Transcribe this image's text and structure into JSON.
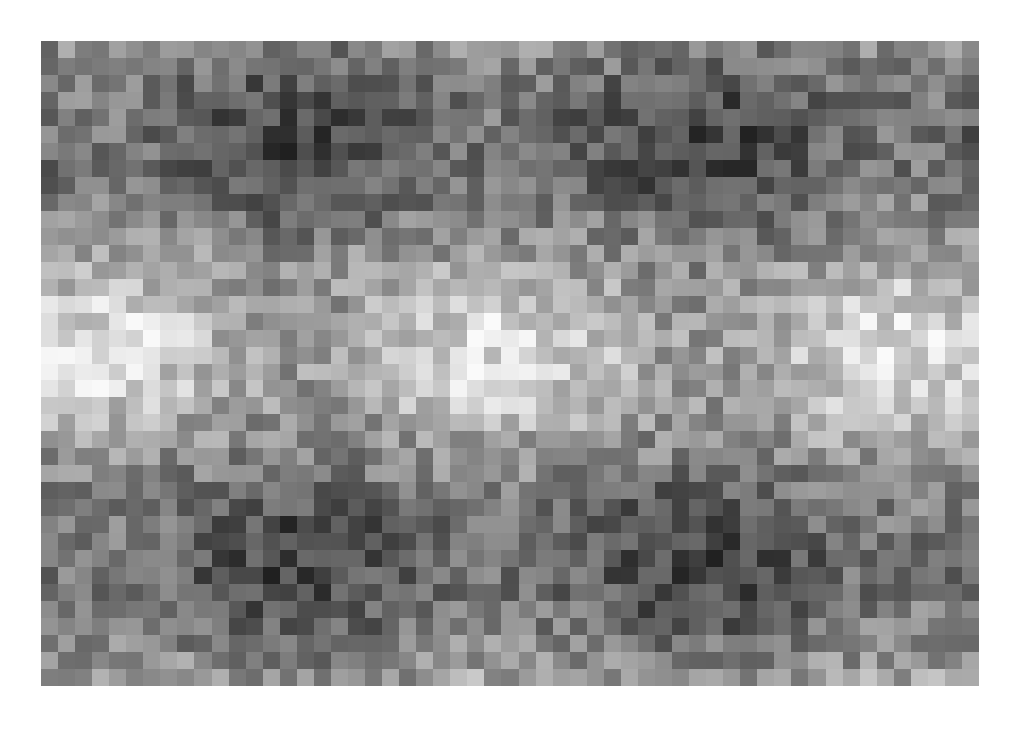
{
  "image": {
    "description": "Grayscale checkered mosaic of small squares forming a smooth wave pattern of dark and light blobs",
    "background_color": "#ffffff",
    "mosaic": {
      "left": 41,
      "top": 41,
      "width": 938,
      "height": 645,
      "columns": 55,
      "rows": 38,
      "field": {
        "base": 0.55,
        "amplitude": 0.38,
        "period_x_px": 400,
        "phase_x_px": 100,
        "period_y_px": 420,
        "phase_y_px": 350,
        "noise": 0.32,
        "seed": 7
      },
      "dark_blob_centers": [
        [
          300,
          150
        ],
        [
          700,
          150
        ],
        [
          300,
          560
        ],
        [
          700,
          560
        ]
      ],
      "light_blob_centers": [
        [
          100,
          350
        ],
        [
          500,
          350
        ],
        [
          900,
          350
        ]
      ]
    }
  }
}
